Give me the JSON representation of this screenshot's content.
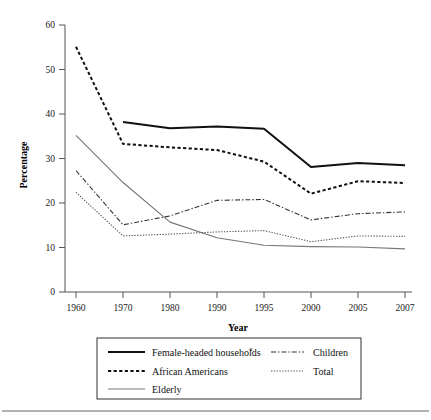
{
  "chart_data": {
    "type": "line",
    "title": "",
    "xlabel": "Year",
    "ylabel": "Percentage",
    "categories": [
      "1960",
      "1970",
      "1980",
      "1990",
      "1995",
      "2000",
      "2005",
      "2007"
    ],
    "x": [
      1960,
      1970,
      1980,
      1990,
      1995,
      2000,
      2005,
      2007
    ],
    "ylim": [
      0,
      60
    ],
    "yticks": [
      0,
      10,
      20,
      30,
      40,
      50,
      60
    ],
    "ytick_labels": [
      "0",
      "10",
      "20",
      "30",
      "40",
      "50",
      "60"
    ],
    "xtick_labels": [
      "1960",
      "1970",
      "1980",
      "1990",
      "1995",
      "2000",
      "2005",
      "2007"
    ],
    "grid": false,
    "legend_position": "below-plot",
    "series": [
      {
        "name": "Female-headed households",
        "legend_label": "Female-headed households",
        "legend_superscript": "a",
        "style": "solid-thick",
        "color": "#111111",
        "values": [
          null,
          38.2,
          36.8,
          37.2,
          36.7,
          28.1,
          29.0,
          28.5
        ]
      },
      {
        "name": "African Americans",
        "legend_label": "African Americans",
        "legend_superscript": "",
        "style": "dashed-thick",
        "color": "#111111",
        "values": [
          55.1,
          33.3,
          32.5,
          31.9,
          29.3,
          22.1,
          24.9,
          24.5
        ]
      },
      {
        "name": "Elderly",
        "legend_label": "Elderly",
        "legend_superscript": "",
        "style": "solid-thin",
        "color": "#777777",
        "values": [
          35.2,
          24.6,
          15.7,
          12.2,
          10.5,
          10.2,
          10.1,
          9.7
        ]
      },
      {
        "name": "Children",
        "legend_label": "Children",
        "legend_superscript": "",
        "style": "dash-dot",
        "color": "#333333",
        "values": [
          27.3,
          15.1,
          17.1,
          20.6,
          20.8,
          16.2,
          17.6,
          18.0
        ]
      },
      {
        "name": "Total",
        "legend_label": "Total",
        "legend_superscript": "",
        "style": "dotted",
        "color": "#555555",
        "values": [
          22.4,
          12.6,
          13.0,
          13.5,
          13.8,
          11.3,
          12.6,
          12.5
        ]
      }
    ]
  },
  "axes": {
    "y_title": "Percentage",
    "x_title": "Year"
  },
  "legend": {
    "entries_left": [
      {
        "label": "Female-headed households",
        "sup": "a",
        "style": "solid-thick"
      },
      {
        "label": "African Americans",
        "sup": "",
        "style": "dashed-thick"
      },
      {
        "label": "Elderly",
        "sup": "",
        "style": "solid-thin"
      }
    ],
    "entries_right": [
      {
        "label": "Children",
        "sup": "",
        "style": "dash-dot"
      },
      {
        "label": "Total",
        "sup": "",
        "style": "dotted"
      }
    ]
  },
  "colors": {
    "axis": "#555555",
    "text": "#111111",
    "elderly": "#777777",
    "legend_border": "#333333",
    "footer_rule": "#999999"
  }
}
